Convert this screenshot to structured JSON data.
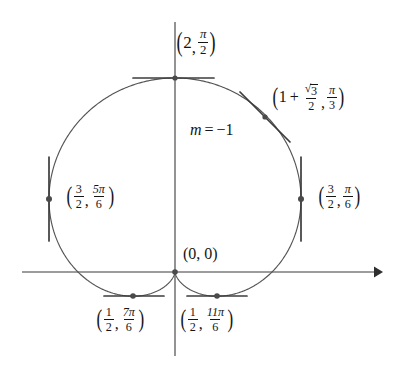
{
  "figure": {
    "curve_equation": "r = 1 + sin(theta)",
    "stroke_color": "#4a4a4a",
    "axis_color": "#3a3a3a",
    "text_color": "#151515",
    "background": "#ffffff"
  },
  "axes": {
    "x_axis": {
      "name": "x-axis",
      "y": 272,
      "x_start": 22,
      "x_end": 382,
      "arrow": "right"
    },
    "y_axis": {
      "name": "y-axis",
      "x": 175,
      "y_start": 22,
      "y_end": 356,
      "arrow": "none"
    },
    "origin": {
      "x": 175,
      "y": 272
    }
  },
  "labels": {
    "top": {
      "r": "2",
      "theta_num": "π",
      "theta_den": "2"
    },
    "pi3": {
      "r_lead": "1",
      "r_plus": "+",
      "r_sqrt_radicand": "3",
      "r_den": "2",
      "theta_num": "π",
      "theta_den": "3"
    },
    "slope": {
      "var": "m",
      "eq": "=",
      "value": "−1",
      "text": "m = −1"
    },
    "left": {
      "r_num": "3",
      "r_den": "2",
      "theta_num": "5π",
      "theta_den": "6"
    },
    "right": {
      "r_num": "3",
      "r_den": "2",
      "theta_num": "π",
      "theta_den": "6"
    },
    "origin": {
      "text": "(0, 0)"
    },
    "bottom_left": {
      "r_num": "1",
      "r_den": "2",
      "theta_num": "7π",
      "theta_den": "6"
    },
    "bottom_right": {
      "r_num": "1",
      "r_den": "2",
      "theta_num": "11π",
      "theta_den": "6"
    },
    "comma": ",",
    "paren_open": "(",
    "paren_close": ")",
    "radical": "√"
  },
  "chart_data": {
    "type": "line",
    "xlabel": "",
    "ylabel": "",
    "grid": false,
    "legend": "none",
    "curve": {
      "name": "cardioid",
      "equation": "r = 1 + sin(theta)",
      "theta_range_deg": [
        0,
        360
      ],
      "scale_px_per_unit": 97,
      "center_px": {
        "x": 175,
        "y": 272
      }
    },
    "points": [
      {
        "name": "top",
        "r": 2,
        "theta": "pi/2",
        "theta_deg": 90,
        "px": {
          "x": 175,
          "y": 78
        },
        "tangent": "horizontal",
        "slope": 0
      },
      {
        "name": "pi-over-3",
        "r": 1.866,
        "theta": "pi/3",
        "theta_deg": 60,
        "px": {
          "x": 265,
          "y": 117
        },
        "tangent": "oblique",
        "slope": -1
      },
      {
        "name": "pi-over-6",
        "r": 1.5,
        "theta": "pi/6",
        "theta_deg": 30,
        "px": {
          "x": 301,
          "y": 199
        },
        "tangent": "vertical",
        "slope": null
      },
      {
        "name": "five-pi-over-6",
        "r": 1.5,
        "theta": "5pi/6",
        "theta_deg": 150,
        "px": {
          "x": 49,
          "y": 199
        },
        "tangent": "vertical",
        "slope": null
      },
      {
        "name": "seven-pi-over-6",
        "r": 0.5,
        "theta": "7pi/6",
        "theta_deg": 210,
        "px": {
          "x": 133,
          "y": 296
        },
        "tangent": "horizontal",
        "slope": 0
      },
      {
        "name": "eleven-pi-over-6",
        "r": 0.5,
        "theta": "11pi/6",
        "theta_deg": 330,
        "px": {
          "x": 217,
          "y": 296
        },
        "tangent": "horizontal",
        "slope": 0
      },
      {
        "name": "origin-cusp",
        "r": 0,
        "theta": "3pi/2",
        "theta_deg": 270,
        "px": {
          "x": 175,
          "y": 272
        },
        "tangent": "cusp",
        "slope": null
      }
    ]
  }
}
